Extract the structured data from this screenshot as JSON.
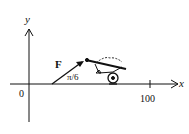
{
  "diagram": {
    "axes": {
      "x_label": "x",
      "y_label": "y",
      "origin_label": "0",
      "tick_label": "100"
    },
    "force": {
      "label": "F",
      "angle_label": "π/6"
    },
    "object": "wheelbarrow-icon",
    "colors": {
      "ink": "#111111",
      "background": "#ffffff"
    }
  }
}
